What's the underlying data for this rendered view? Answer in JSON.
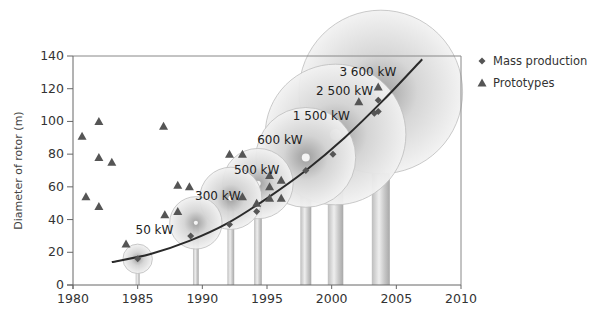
{
  "chart_data": {
    "type": "scatter",
    "title": "",
    "xlabel": "",
    "ylabel": "Diameter of rotor (m)",
    "xlim": [
      1980,
      2010
    ],
    "ylim": [
      0,
      140
    ],
    "x_ticks": [
      1980,
      1985,
      1990,
      1995,
      2000,
      2005,
      2010
    ],
    "y_ticks": [
      0,
      20,
      40,
      60,
      80,
      100,
      120,
      140
    ],
    "grid": false,
    "legend_position": "top-right",
    "legend": [
      {
        "name": "Mass production",
        "marker": "diamond",
        "color": "#555555"
      },
      {
        "name": "Prototypes",
        "marker": "triangle",
        "color": "#555555"
      }
    ],
    "series": [
      {
        "name": "Mass production",
        "marker": "diamond",
        "points": [
          {
            "x": 1985,
            "y": 16
          },
          {
            "x": 1989.1,
            "y": 30
          },
          {
            "x": 1992.1,
            "y": 37
          },
          {
            "x": 1994.2,
            "y": 45
          },
          {
            "x": 1998,
            "y": 70
          },
          {
            "x": 2000.1,
            "y": 80
          },
          {
            "x": 2003.6,
            "y": 113
          },
          {
            "x": 2003.6,
            "y": 106
          },
          {
            "x": 2003.3,
            "y": 105
          }
        ]
      },
      {
        "name": "Prototypes",
        "marker": "triangle",
        "points": [
          {
            "x": 1980.7,
            "y": 91
          },
          {
            "x": 1982,
            "y": 100
          },
          {
            "x": 1982,
            "y": 78
          },
          {
            "x": 1983,
            "y": 75
          },
          {
            "x": 1981,
            "y": 54
          },
          {
            "x": 1982,
            "y": 48
          },
          {
            "x": 1987,
            "y": 97
          },
          {
            "x": 1984.1,
            "y": 25
          },
          {
            "x": 1987.1,
            "y": 43
          },
          {
            "x": 1988.1,
            "y": 61
          },
          {
            "x": 1989,
            "y": 60
          },
          {
            "x": 1988.1,
            "y": 45
          },
          {
            "x": 1992.1,
            "y": 80
          },
          {
            "x": 1993.1,
            "y": 80
          },
          {
            "x": 1993.1,
            "y": 54
          },
          {
            "x": 1994.2,
            "y": 50
          },
          {
            "x": 1995.2,
            "y": 67
          },
          {
            "x": 1995.2,
            "y": 60
          },
          {
            "x": 1995.2,
            "y": 53
          },
          {
            "x": 1996.1,
            "y": 64
          },
          {
            "x": 1996.1,
            "y": 53
          },
          {
            "x": 2002.1,
            "y": 112
          },
          {
            "x": 2003.6,
            "y": 121
          }
        ]
      }
    ],
    "trend_curve": {
      "name": "Trend",
      "points": [
        {
          "x": 1983,
          "y": 14
        },
        {
          "x": 1986,
          "y": 19
        },
        {
          "x": 1989,
          "y": 27
        },
        {
          "x": 1992,
          "y": 38
        },
        {
          "x": 1995,
          "y": 53
        },
        {
          "x": 1998,
          "y": 70
        },
        {
          "x": 2001,
          "y": 90
        },
        {
          "x": 2004,
          "y": 113
        },
        {
          "x": 2007,
          "y": 138
        }
      ]
    },
    "annotations": [
      {
        "label": "50 kW",
        "year": 1985,
        "hub_height": 16,
        "rotor_diameter": 18
      },
      {
        "label": "300 kW",
        "year": 1989.5,
        "hub_height": 38,
        "rotor_diameter": 32
      },
      {
        "label": "500 kW",
        "year": 1992.2,
        "hub_height": 53,
        "rotor_diameter": 38
      },
      {
        "label": "600 kW",
        "year": 1994.3,
        "hub_height": 62,
        "rotor_diameter": 43
      },
      {
        "label": "1 500 kW",
        "year": 1998,
        "hub_height": 78,
        "rotor_diameter": 61
      },
      {
        "label": "2 500 kW",
        "year": 2000.3,
        "hub_height": 92,
        "rotor_diameter": 86
      },
      {
        "label": "3 600 kW",
        "year": 2003.8,
        "hub_height": 118,
        "rotor_diameter": 100
      }
    ]
  }
}
